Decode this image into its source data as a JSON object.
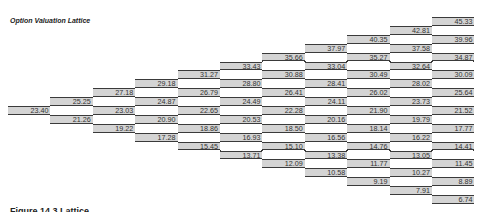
{
  "title": "Option Valuation Lattice",
  "footer_text": "Figure 14.3 Lattice",
  "colors": {
    "cell_fill": "#d4d4d4",
    "cell_border": "#3a3a3a",
    "text": "#333333"
  },
  "layout": {
    "left": 8,
    "col_pitch": 42.4,
    "top": 17,
    "row_pitch": 8.9,
    "steps": 10
  },
  "lattice": {
    "columns": [
      {
        "step": 0,
        "values": [
          "23.40"
        ]
      },
      {
        "step": 1,
        "values": [
          "25.25",
          "21.26"
        ]
      },
      {
        "step": 2,
        "values": [
          "27.18",
          "23.03",
          "19.22"
        ]
      },
      {
        "step": 3,
        "values": [
          "29.18",
          "24.87",
          "20.90",
          "17.28"
        ]
      },
      {
        "step": 4,
        "values": [
          "31.27",
          "26.79",
          "22.65",
          "18.86",
          "15.45"
        ]
      },
      {
        "step": 5,
        "values": [
          "33.43",
          "28.80",
          "24.49",
          "20.53",
          "16.93",
          "13.71"
        ]
      },
      {
        "step": 6,
        "values": [
          "35.66",
          "30.88",
          "26.41",
          "22.28",
          "18.50",
          "15.10",
          "12.09"
        ]
      },
      {
        "step": 7,
        "values": [
          "37.97",
          "33.04",
          "28.41",
          "24.11",
          "20.16",
          "16.56",
          "13.38",
          "10.58"
        ]
      },
      {
        "step": 8,
        "values": [
          "40.35",
          "35.27",
          "30.49",
          "26.02",
          "21.90",
          "18.14",
          "14.76",
          "11.77",
          "9.19"
        ]
      },
      {
        "step": 9,
        "values": [
          "42.81",
          "37.58",
          "32.64",
          "28.02",
          "23.73",
          "19.79",
          "16.22",
          "13.05",
          "10.27",
          "7.91"
        ]
      },
      {
        "step": 10,
        "values": [
          "45.33",
          "39.96",
          "34.87",
          "30.09",
          "25.64",
          "21.52",
          "17.77",
          "14.41",
          "11.45",
          "8.89",
          "6.74"
        ]
      }
    ]
  }
}
